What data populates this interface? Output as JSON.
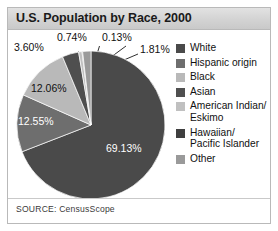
{
  "figure": {
    "title": "U.S. Population by Race, 2000",
    "source_prefix": "SOURCE:",
    "source_name": "CensusScope",
    "source_full": "SOURCE: CensusScope"
  },
  "colors": {
    "white": "#4a4a4a",
    "hispanic": "#6e6e6e",
    "black": "#b9b9b9",
    "asian": "#4f4f4f",
    "american_indian": "#c0c0c0",
    "hawaiian": "#3f3f3f",
    "other": "#9a9a9a",
    "title_band": "#d6d6d6",
    "frame_border": "#b9b9b9",
    "label_inside": "#ffffff",
    "label_outside": "#111111"
  },
  "legend": {
    "items": [
      {
        "label": "White",
        "color_key": "white",
        "swatch": "#4a4a4a"
      },
      {
        "label": "Hispanic origin",
        "color_key": "hispanic",
        "swatch": "#6e6e6e"
      },
      {
        "label": "Black",
        "color_key": "black",
        "swatch": "#b9b9b9"
      },
      {
        "label": "Asian",
        "color_key": "asian",
        "swatch": "#4f4f4f"
      },
      {
        "label": "American Indian/\nEskimo",
        "color_key": "american_indian",
        "swatch": "#c0c0c0"
      },
      {
        "label": "Hawaiian/\nPacific Islander",
        "color_key": "hawaiian",
        "swatch": "#3f3f3f"
      },
      {
        "label": "Other",
        "color_key": "other",
        "swatch": "#9a9a9a"
      }
    ]
  },
  "chart_data": {
    "type": "pie",
    "title": "U.S. Population by Race, 2000",
    "xlabel": "",
    "ylabel": "",
    "units": "percent",
    "legend_position": "right",
    "grid": false,
    "start_angle_deg": 0,
    "direction": "clockwise",
    "categories": [
      "White",
      "Hispanic origin",
      "Black",
      "Asian",
      "American Indian/Eskimo",
      "Hawaiian/Pacific Islander",
      "Other"
    ],
    "values": [
      69.13,
      12.55,
      12.06,
      3.6,
      0.74,
      0.13,
      1.81
    ],
    "value_labels": [
      "69.13%",
      "12.55%",
      "12.06%",
      "3.60%",
      "0.74%",
      "0.13%",
      "1.81%"
    ],
    "colors": [
      "#4a4a4a",
      "#6e6e6e",
      "#b9b9b9",
      "#4f4f4f",
      "#c0c0c0",
      "#3f3f3f",
      "#9a9a9a"
    ],
    "annotations": [
      {
        "text": "69.13%",
        "category": "White",
        "placement": "inside"
      },
      {
        "text": "12.55%",
        "category": "Hispanic origin",
        "placement": "inside"
      },
      {
        "text": "12.06%",
        "category": "Black",
        "placement": "inside"
      },
      {
        "text": "3.60%",
        "category": "Asian",
        "placement": "outside",
        "leader_line": true
      },
      {
        "text": "0.74%",
        "category": "American Indian/Eskimo",
        "placement": "outside",
        "leader_line": true
      },
      {
        "text": "0.13%",
        "category": "Hawaiian/Pacific Islander",
        "placement": "outside",
        "leader_line": true
      },
      {
        "text": "1.81%",
        "category": "Other",
        "placement": "outside",
        "leader_line": true
      }
    ],
    "source": "SOURCE: CensusScope"
  }
}
